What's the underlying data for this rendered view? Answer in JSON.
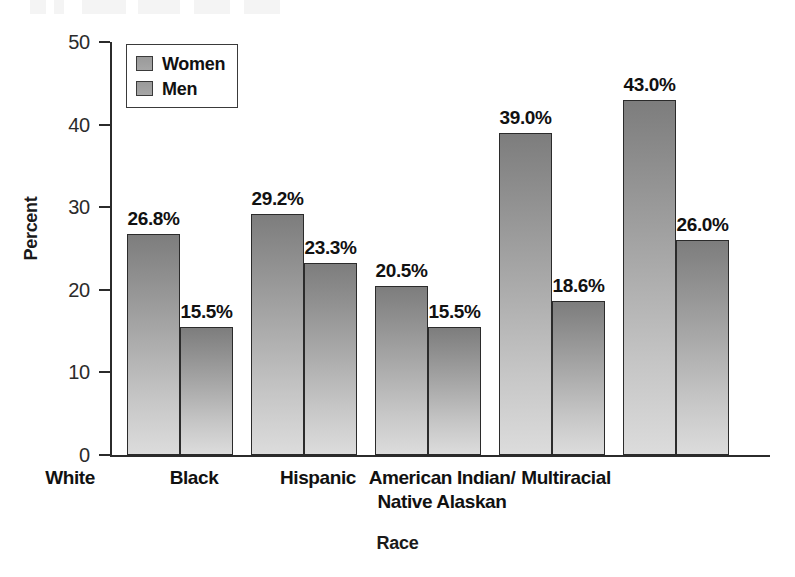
{
  "chart_data": {
    "type": "bar",
    "title": "",
    "subtitle": "",
    "xlabel": "Race",
    "ylabel": "Percent",
    "categories": [
      "White",
      "Black",
      "Hispanic",
      "American Indian/\nNative Alaskan",
      "Multiracial"
    ],
    "category_labels": [
      {
        "line1": "White",
        "line2": ""
      },
      {
        "line1": "Black",
        "line2": ""
      },
      {
        "line1": "Hispanic",
        "line2": ""
      },
      {
        "line1": "American Indian/",
        "line2": "Native Alaskan"
      },
      {
        "line1": "Multiracial",
        "line2": ""
      }
    ],
    "series": [
      {
        "name": "Women",
        "values": [
          26.8,
          29.2,
          20.5,
          39.0,
          43.0
        ],
        "labels": [
          "26.8%",
          "29.2%",
          "20.5%",
          "39.0%",
          "43.0%"
        ],
        "color": "#8e8e8e"
      },
      {
        "name": "Men",
        "values": [
          15.5,
          23.3,
          15.5,
          18.6,
          26.0
        ],
        "labels": [
          "15.5%",
          "23.3%",
          "15.5%",
          "18.6%",
          "26.0%"
        ],
        "color": "#a8a8a8"
      }
    ],
    "ylim": [
      0,
      50
    ],
    "yticks": [
      0,
      10,
      20,
      30,
      40,
      50
    ],
    "ytick_labels": [
      "0",
      "10",
      "20",
      "30",
      "40",
      "50"
    ],
    "grid": false,
    "legend_position": "top-left",
    "legend_entries": [
      "Women",
      "Men"
    ],
    "value_suffix": "%"
  },
  "colors": {
    "axis": "#2b2b2b",
    "text": "#111111",
    "bar_top": "#7d7d7d",
    "bar_bottom": "#dcdcdc",
    "bar_outline": "#2b2b2b",
    "background": "#ffffff"
  }
}
